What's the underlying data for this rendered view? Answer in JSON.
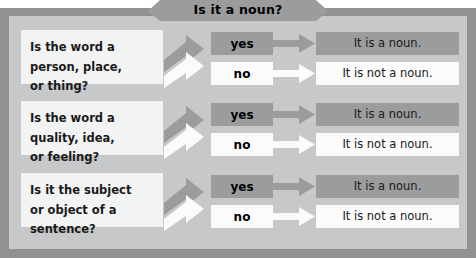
{
  "header": {
    "title": "Is it a noun?"
  },
  "colors": {
    "outer_frame": "#8f9193",
    "panel_background": "#c6c8c9",
    "banner": "#9a9c9e",
    "dark_box": "#9a9c9e",
    "light_box": "#fbfbfb",
    "question_box": "#f2f3f3",
    "text": "#1a1a1a"
  },
  "rows": [
    {
      "question": "Is the word a\nperson, place,\nor thing?",
      "yes_label": "yes",
      "no_label": "no",
      "yes_result": "It is a noun.",
      "no_result": "It is not a noun."
    },
    {
      "question": "Is the word a\nquality, idea,\nor feeling?",
      "yes_label": "yes",
      "no_label": "no",
      "yes_result": "It is a noun.",
      "no_result": "It is not a noun."
    },
    {
      "question": "Is it the subject\nor object of a\nsentence?",
      "yes_label": "yes",
      "no_label": "no",
      "yes_result": "It is a noun.",
      "no_result": "It is not a noun."
    }
  ]
}
